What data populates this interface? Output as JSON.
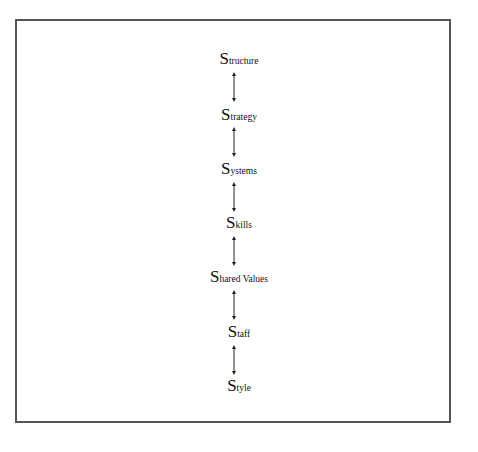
{
  "diagram": {
    "nodes": [
      {
        "cap": "S",
        "rest": "tructure",
        "label": "Structure"
      },
      {
        "cap": "S",
        "rest": "trategy",
        "label": "Strategy"
      },
      {
        "cap": "S",
        "rest": "ystems",
        "label": "Systems"
      },
      {
        "cap": "S",
        "rest": "kills",
        "label": "Skills"
      },
      {
        "cap": "S",
        "rest": "hared Values",
        "label": "Shared Values"
      },
      {
        "cap": "S",
        "rest": "taff",
        "label": "Staff"
      },
      {
        "cap": "S",
        "rest": "tyle",
        "label": "Style"
      }
    ],
    "edges": [
      {
        "from": "Structure",
        "to": "Strategy",
        "type": "bidirectional"
      },
      {
        "from": "Strategy",
        "to": "Systems",
        "type": "bidirectional"
      },
      {
        "from": "Systems",
        "to": "Skills",
        "type": "bidirectional"
      },
      {
        "from": "Skills",
        "to": "Shared Values",
        "type": "bidirectional"
      },
      {
        "from": "Shared Values",
        "to": "Staff",
        "type": "bidirectional"
      },
      {
        "from": "Staff",
        "to": "Style",
        "type": "bidirectional"
      }
    ],
    "colors": {
      "border": "#555555",
      "text": "#111111",
      "arrow": "#222222"
    }
  }
}
